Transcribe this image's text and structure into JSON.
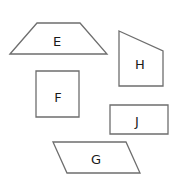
{
  "diagram": {
    "type": "shapes",
    "stroke_color": "#6e6e6e",
    "shapes": [
      {
        "label": "E",
        "kind": "trapezoid",
        "points": "10,54 37,23 80,23 107,54",
        "label_x": 57,
        "label_y": 41
      },
      {
        "label": "H",
        "kind": "quadrilateral",
        "points": "119,31 163,51 163,86 119,86",
        "label_x": 140,
        "label_y": 64
      },
      {
        "label": "F",
        "kind": "square",
        "points": "36,71 79,71 79,117 36,117",
        "label_x": 58,
        "label_y": 97
      },
      {
        "label": "J",
        "kind": "rectangle",
        "points": "110,105 168,105 168,134 110,134",
        "label_x": 137,
        "label_y": 121
      },
      {
        "label": "G",
        "kind": "parallelogram",
        "points": "53,142 126,142 140,173 67,173",
        "label_x": 96,
        "label_y": 159
      }
    ]
  }
}
